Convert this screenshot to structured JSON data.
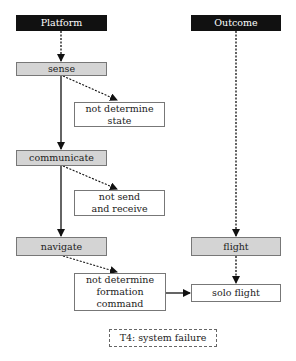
{
  "columns": {
    "platform": {
      "label": "Platform"
    },
    "outcome": {
      "label": "Outcome"
    }
  },
  "platform_steps": [
    {
      "id": "sense",
      "label": "sense",
      "failure": "not determine state"
    },
    {
      "id": "communicate",
      "label": "communicate",
      "failure": "not send and receive"
    },
    {
      "id": "navigate",
      "label": "navigate",
      "failure": "not determine formation command"
    }
  ],
  "failures": {
    "state": {
      "line1": "not determine",
      "line2": "state"
    },
    "send": {
      "line1": "not send",
      "line2": "and receive"
    },
    "formation": {
      "line1": "not determine",
      "line2": "formation",
      "line3": "command"
    }
  },
  "outcome_steps": [
    {
      "id": "flight",
      "label": "flight"
    },
    {
      "id": "solo_flight",
      "label": "solo flight"
    }
  ],
  "legend": {
    "label": "T4: system failure"
  },
  "colors": {
    "header_bg": "#111111",
    "step_bg": "#d4d4d4",
    "border": "#777777"
  }
}
